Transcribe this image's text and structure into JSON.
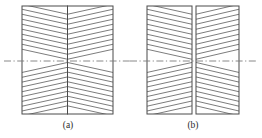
{
  "figure": {
    "type": "diagram",
    "background_color": "#ffffff",
    "line_color": "#5a5a5a",
    "border_color": "#4a4a4a",
    "centerline_color": "#7a7a7a",
    "panels": [
      {
        "id": "panel-a",
        "caption": "(a)",
        "caption_x": 68,
        "caption_y": 128,
        "box": {
          "x": 22,
          "y": 6,
          "width": 91,
          "height": 108
        },
        "split_x": 67.5,
        "gap": 0,
        "centerline_y": 61,
        "centerline_x1": 4,
        "centerline_x2": 131,
        "hatch_count": 11,
        "chevron_apex_offsets": [
          0,
          4,
          9,
          14,
          19,
          24,
          29,
          34,
          39,
          44,
          49
        ],
        "note": "Halves joined; chevrons point downward above centerline and upward below centerline"
      },
      {
        "id": "panel-b",
        "caption": "(b)",
        "caption_x": 193,
        "caption_y": 128,
        "box": {
          "x": 147,
          "y": 6,
          "width": 92,
          "height": 108
        },
        "split_x": 194,
        "gap": 4,
        "centerline_y": 61,
        "centerline_x1": 130,
        "centerline_x2": 258,
        "hatch_count": 11,
        "chevron_apex_offsets": [
          0,
          4,
          9,
          14,
          19,
          24,
          29,
          34,
          39,
          44,
          49
        ],
        "note": "Halves separated by a narrow vertical gap; same chevron hatching"
      }
    ]
  },
  "captions": {
    "a_label": "(a)",
    "b_label": "(b)"
  }
}
